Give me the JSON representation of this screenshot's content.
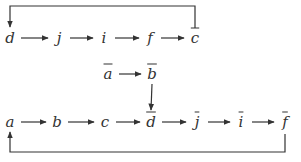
{
  "diagram": {
    "type": "commutative-chain",
    "colors": {
      "line": "#333333",
      "text": "#333333",
      "background": "#ffffff"
    },
    "nodes": [
      {
        "id": "d",
        "label": "d",
        "bar": false,
        "x": 10,
        "y": 38
      },
      {
        "id": "j",
        "label": "j",
        "bar": false,
        "x": 59,
        "y": 38
      },
      {
        "id": "i",
        "label": "i",
        "bar": false,
        "x": 104,
        "y": 38
      },
      {
        "id": "f",
        "label": "f",
        "bar": false,
        "x": 150,
        "y": 38
      },
      {
        "id": "cbar",
        "label": "c",
        "bar": true,
        "x": 195,
        "y": 38
      },
      {
        "id": "abar",
        "label": "a",
        "bar": true,
        "x": 108,
        "y": 74
      },
      {
        "id": "bbar",
        "label": "b",
        "bar": true,
        "x": 152,
        "y": 74
      },
      {
        "id": "a",
        "label": "a",
        "bar": false,
        "x": 10,
        "y": 122
      },
      {
        "id": "b",
        "label": "b",
        "bar": false,
        "x": 57,
        "y": 122
      },
      {
        "id": "c",
        "label": "c",
        "bar": false,
        "x": 105,
        "y": 122
      },
      {
        "id": "dbar",
        "label": "d",
        "bar": true,
        "x": 151,
        "y": 122
      },
      {
        "id": "jbar",
        "label": "j",
        "bar": true,
        "x": 197,
        "y": 122
      },
      {
        "id": "ibar",
        "label": "i",
        "bar": true,
        "x": 241,
        "y": 122
      },
      {
        "id": "fbar",
        "label": "f",
        "bar": true,
        "x": 285,
        "y": 122
      }
    ],
    "edges": [
      {
        "from": "d",
        "to": "j"
      },
      {
        "from": "j",
        "to": "i"
      },
      {
        "from": "i",
        "to": "f"
      },
      {
        "from": "f",
        "to": "cbar"
      },
      {
        "from": "cbar",
        "to": "d",
        "route": "loop-top"
      },
      {
        "from": "abar",
        "to": "bbar"
      },
      {
        "from": "bbar",
        "to": "dbar",
        "route": "vertical"
      },
      {
        "from": "a",
        "to": "b"
      },
      {
        "from": "b",
        "to": "c"
      },
      {
        "from": "c",
        "to": "dbar"
      },
      {
        "from": "dbar",
        "to": "jbar"
      },
      {
        "from": "jbar",
        "to": "ibar"
      },
      {
        "from": "ibar",
        "to": "fbar"
      },
      {
        "from": "fbar",
        "to": "a",
        "route": "loop-bottom"
      }
    ]
  }
}
